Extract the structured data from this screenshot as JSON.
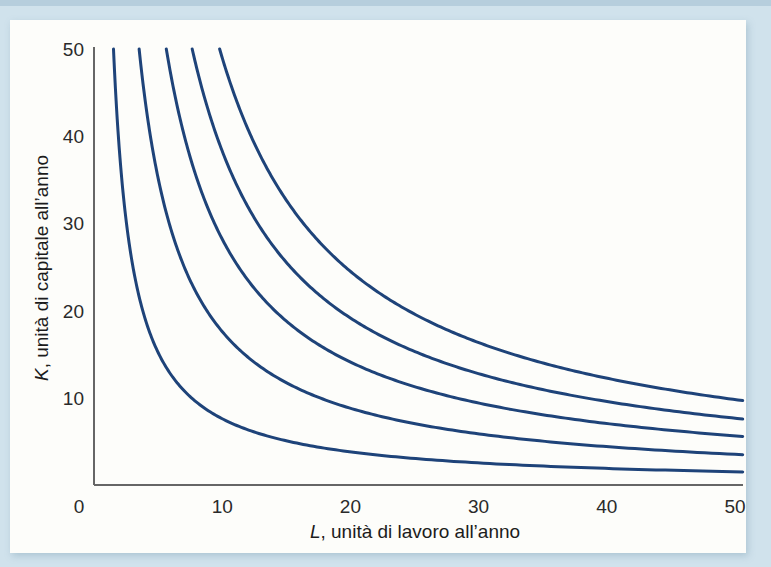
{
  "page": {
    "background_color": "#d0e2ec",
    "panel_color": "#fdfdfa"
  },
  "chart_data": {
    "type": "line",
    "subtype": "isoquant-map",
    "title": "",
    "xlabel": "L, unità di lavoro all’anno",
    "xlabel_var": "L",
    "xlabel_rest": ", unità di lavoro all’anno",
    "ylabel": "K, unità di capitale all’anno",
    "ylabel_var": "K",
    "ylabel_rest": ", unità di capitale all’anno",
    "xlim": [
      0,
      50
    ],
    "ylim": [
      0,
      50
    ],
    "x_ticks": [
      0,
      10,
      20,
      30,
      40,
      50
    ],
    "y_ticks": [
      10,
      20,
      30,
      40,
      50
    ],
    "grid": false,
    "legend": false,
    "axis_color": "#666666",
    "curve_color": "#1e4379",
    "tick_text_color": "#2a2a2a",
    "series": [
      {
        "name": "isoquant-1",
        "model": "K = constant / L",
        "constant": 76,
        "start_point": [
          1.5,
          50
        ],
        "end_point": [
          50,
          1.5
        ]
      },
      {
        "name": "isoquant-2",
        "model": "K = constant / L",
        "constant": 176,
        "start_point": [
          3.5,
          50
        ],
        "end_point": [
          50,
          3.5
        ]
      },
      {
        "name": "isoquant-3",
        "model": "K = constant / L",
        "constant": 282,
        "start_point": [
          5.6,
          50
        ],
        "end_point": [
          50,
          5.6
        ]
      },
      {
        "name": "isoquant-4",
        "model": "K = constant / L",
        "constant": 383,
        "start_point": [
          7.7,
          50
        ],
        "end_point": [
          50,
          7.7
        ]
      },
      {
        "name": "isoquant-5",
        "model": "K = constant / L",
        "constant": 490,
        "start_point": [
          9.8,
          50
        ],
        "end_point": [
          50,
          9.8
        ]
      }
    ]
  }
}
